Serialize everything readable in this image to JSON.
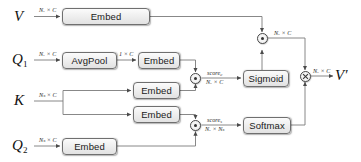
{
  "diagram": {
    "inputs": [
      {
        "id": "V",
        "symbol": "V",
        "subscript": "",
        "dim": "Nᵥ × C"
      },
      {
        "id": "Q1",
        "symbol": "Q",
        "subscript": "1",
        "dim": "Nᵥ × C"
      },
      {
        "id": "K",
        "symbol": "K",
        "subscript": "",
        "dim": "Nₛ × C"
      },
      {
        "id": "Q2",
        "symbol": "Q",
        "subscript": "2",
        "dim": "Nₛ × C"
      }
    ],
    "output": {
      "symbol": "V",
      "prime": "′",
      "dim": "Nᵥ × C"
    },
    "blocks": [
      {
        "id": "embed-v",
        "label": "Embed"
      },
      {
        "id": "avgpool-q1",
        "label": "AvgPool"
      },
      {
        "id": "embed-q1",
        "label": "Embed"
      },
      {
        "id": "embed-k-top",
        "label": "Embed"
      },
      {
        "id": "embed-k-bottom",
        "label": "Embed"
      },
      {
        "id": "embed-q2",
        "label": "Embed"
      },
      {
        "id": "sigmoid",
        "label": "Sigmoid"
      },
      {
        "id": "softmax",
        "label": "Softmax"
      }
    ],
    "operators": [
      {
        "id": "dot-channel",
        "glyph": "dot",
        "name": "dot-product"
      },
      {
        "id": "dot-spatial",
        "glyph": "dot",
        "name": "dot-product"
      },
      {
        "id": "dot-gate",
        "glyph": "dot",
        "name": "dot-product"
      },
      {
        "id": "times-out",
        "glyph": "times",
        "name": "elementwise-multiply"
      }
    ],
    "edge_labels": {
      "v_in": "Nᵥ × C",
      "q1_in": "Nᵥ × C",
      "q1_pooled": "1 × C",
      "k_in": "Nₛ × C",
      "q2_in": "Nₛ × C",
      "score_c_name": "score",
      "score_c_sub": "c",
      "score_c_dim": "Nᵥ × C",
      "score_s_name": "score",
      "score_s_sub": "s",
      "score_s_dim": "Nᵥ × Nₛ",
      "gated_v": "Nᵥ × C",
      "out_dim": "Nᵥ × C"
    },
    "colors": {
      "wire": "#7a7a7a",
      "box_border": "#6f6f6f",
      "box_fill": "#ededed",
      "text": "#1a1a1a"
    }
  }
}
